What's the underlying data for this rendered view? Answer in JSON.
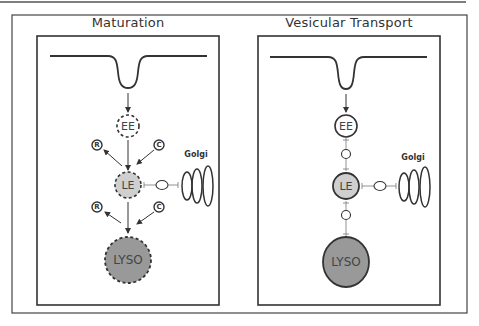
{
  "figure": {
    "panels": [
      {
        "title": "Maturation",
        "organelles": {
          "early_endosome": "EE",
          "late_endosome": "LE",
          "lysosome": "LYSO"
        },
        "side_markers": [
          "R",
          "C",
          "R",
          "C"
        ],
        "golgi_label": "Golgi",
        "border_style": "dashed"
      },
      {
        "title": "Vesicular Transport",
        "organelles": {
          "early_endosome": "EE",
          "late_endosome": "LE",
          "lysosome": "LYSO"
        },
        "golgi_label": "Golgi",
        "border_style": "solid"
      }
    ],
    "colors": {
      "stroke": "#333333",
      "late_endosome_fill": "#cccccc",
      "lysosome_fill": "#999999",
      "background": "#ffffff"
    }
  }
}
